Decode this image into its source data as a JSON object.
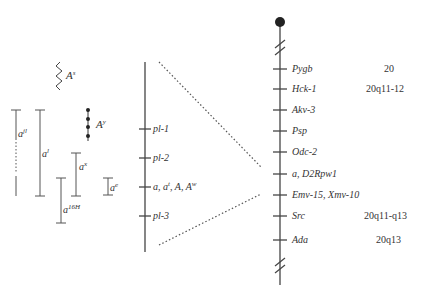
{
  "figure": {
    "type": "genetic-map",
    "chromosome_colors": {
      "line": "#444444",
      "centromere": "#222222",
      "dotted": "#555555"
    }
  },
  "alleles": {
    "As": {
      "base": "A",
      "sup": "s"
    },
    "Ay": {
      "base": "A",
      "sup": "y"
    },
    "ajl": {
      "base": "a",
      "sup": "jl"
    },
    "al": {
      "base": "a",
      "sup": "l"
    },
    "ax": {
      "base": "a",
      "sup": "x"
    },
    "ae": {
      "base": "a",
      "sup": "e"
    },
    "a16H": {
      "base": "a",
      "sup": "16H"
    }
  },
  "detail_map": {
    "loci": [
      {
        "id": "pl1",
        "label": "pl-1"
      },
      {
        "id": "pl2",
        "label": "pl-2"
      },
      {
        "id": "agouti",
        "label_a": "a, a",
        "label_sup": "t",
        "label_b": ", A, A",
        "label_sup2": "w"
      },
      {
        "id": "pl3",
        "label": "pl-3"
      }
    ]
  },
  "chromosome_map": {
    "loci": [
      {
        "gene": "Pygb",
        "human": "20"
      },
      {
        "gene": "Hck-1",
        "human": "20q11-12"
      },
      {
        "gene": "Akv-3",
        "human": ""
      },
      {
        "gene": "Psp",
        "human": ""
      },
      {
        "gene": "Odc-2",
        "human": ""
      },
      {
        "gene": "a, D2Rpw1",
        "human": ""
      },
      {
        "gene": "Emv-15, Xmv-10",
        "human": ""
      },
      {
        "gene": "Src",
        "human": "20q11-q13"
      },
      {
        "gene": "Ada",
        "human": "20q13"
      }
    ]
  }
}
